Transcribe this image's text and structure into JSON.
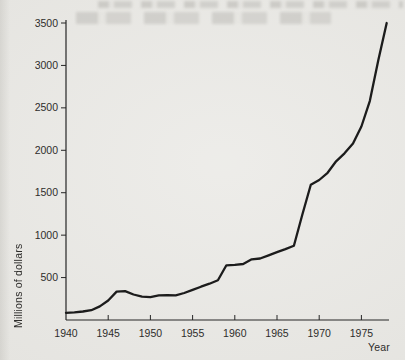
{
  "page": {
    "background_color": "#e9e8e4",
    "ink_color": "#262626"
  },
  "chart_data": {
    "type": "line",
    "title": "",
    "xlabel": "Year",
    "ylabel": "Millions of dollars",
    "grid": false,
    "legend": null,
    "xlim": [
      1940,
      1978.6
    ],
    "ylim": [
      0,
      3540
    ],
    "x_ticks": [
      1940,
      1945,
      1950,
      1955,
      1960,
      1965,
      1970,
      1975
    ],
    "y_ticks": [
      500,
      1000,
      1500,
      2000,
      2500,
      3000,
      3500
    ],
    "series": [
      {
        "name": "spending",
        "color": "#1c1c1c",
        "line_width": 2.3,
        "x": [
          1940,
          1941,
          1942,
          1943,
          1944,
          1945,
          1946,
          1947,
          1948,
          1949,
          1950,
          1951,
          1952,
          1953,
          1954,
          1955,
          1956,
          1957,
          1958,
          1959,
          1960,
          1961,
          1962,
          1963,
          1964,
          1965,
          1966,
          1967,
          1968,
          1969,
          1970,
          1971,
          1972,
          1973,
          1974,
          1975,
          1976,
          1977,
          1978
        ],
        "y": [
          85,
          90,
          100,
          115,
          160,
          230,
          335,
          340,
          300,
          275,
          270,
          290,
          292,
          290,
          318,
          355,
          392,
          428,
          468,
          645,
          650,
          660,
          715,
          725,
          762,
          800,
          835,
          875,
          1240,
          1595,
          1650,
          1735,
          1870,
          1965,
          2080,
          2280,
          2580,
          3060,
          3500
        ]
      }
    ]
  }
}
